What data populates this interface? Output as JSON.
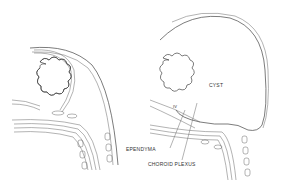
{
  "figure": {
    "panels": [
      {
        "name": "normal",
        "description": "Sagittal section of normal posterior fossa"
      },
      {
        "name": "cyst",
        "description": "Sagittal section showing cystic dilatation of fourth ventricle"
      }
    ],
    "labels": {
      "cyst": "CYST",
      "ventricle": "IV",
      "ependyma": "EPENDYMA",
      "choroid_plexus": "CHOROID PLEXUS"
    },
    "colors": {
      "line": "#444444",
      "background": "#ffffff"
    }
  }
}
